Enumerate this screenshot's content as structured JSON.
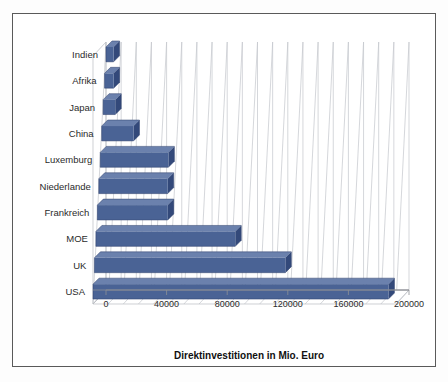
{
  "chart_data": {
    "type": "bar",
    "orientation": "horizontal",
    "title": "",
    "xlabel": "Direktinvestitionen  in Mio. Euro",
    "ylabel": "",
    "xlim": [
      0,
      200000
    ],
    "xticks": [
      "0",
      "40000",
      "80000",
      "120000",
      "160000",
      "200000"
    ],
    "xtick_values": [
      0,
      40000,
      80000,
      120000,
      160000,
      200000
    ],
    "grid": true,
    "legend": "none",
    "style": "3d-bar",
    "categories": [
      "Indien",
      "Afrika",
      "Japan",
      "China",
      "Luxemburg",
      "Niederlande",
      "Frankreich",
      "MOE",
      "UK",
      "USA"
    ],
    "values": [
      5000,
      6000,
      8000,
      21000,
      45000,
      45500,
      46500,
      92000,
      126000,
      195000
    ],
    "series": [
      {
        "name": "Direktinvestitionen",
        "values": [
          5000,
          6000,
          8000,
          21000,
          45000,
          45500,
          46500,
          92000,
          126000,
          195000
        ]
      }
    ],
    "colors": {
      "bar_front": "#4a6395",
      "bar_top": "#6b81ad",
      "bar_side": "#33497a",
      "gridline": "#c3c6cc",
      "frame": "#5a5a5a",
      "background": "#ffffff",
      "text": "#2b2b2b"
    }
  }
}
